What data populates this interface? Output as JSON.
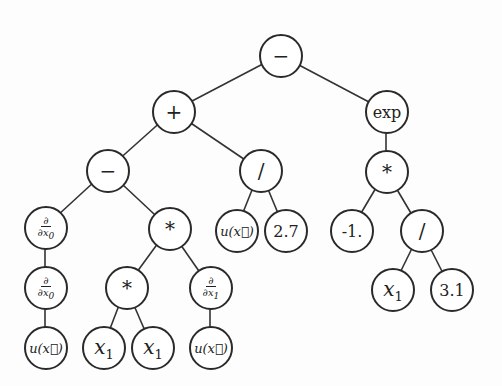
{
  "diagram": {
    "type": "expression-tree",
    "nodes": [
      {
        "id": "root",
        "label": "−",
        "x": 280,
        "y": 55,
        "kind": "op"
      },
      {
        "id": "plus",
        "label": "+",
        "x": 173,
        "y": 111,
        "kind": "op"
      },
      {
        "id": "exp",
        "label": "exp",
        "x": 386,
        "y": 111,
        "kind": "num"
      },
      {
        "id": "minus2",
        "label": "−",
        "x": 107,
        "y": 170,
        "kind": "op"
      },
      {
        "id": "div1",
        "label": "/",
        "x": 260,
        "y": 170,
        "kind": "op"
      },
      {
        "id": "mul_r",
        "label": "*",
        "x": 386,
        "y": 171,
        "kind": "op"
      },
      {
        "id": "d0a",
        "label_top": "∂",
        "label_bottom": "∂x",
        "sub": "0",
        "x": 45,
        "y": 227,
        "kind": "deriv"
      },
      {
        "id": "mul1",
        "label": "*",
        "x": 169,
        "y": 228,
        "kind": "op"
      },
      {
        "id": "u1",
        "label": "u(x⃗)",
        "x": 236,
        "y": 230,
        "kind": "fn"
      },
      {
        "id": "c27",
        "label": "2.7",
        "x": 285,
        "y": 230,
        "kind": "num"
      },
      {
        "id": "cm1",
        "label": "-1.",
        "x": 351,
        "y": 230,
        "kind": "num"
      },
      {
        "id": "div2",
        "label": "/",
        "x": 421,
        "y": 230,
        "kind": "op"
      },
      {
        "id": "d0b",
        "label_top": "∂",
        "label_bottom": "∂x",
        "sub": "0",
        "x": 45,
        "y": 287,
        "kind": "deriv"
      },
      {
        "id": "mul2",
        "label": "*",
        "x": 126,
        "y": 287,
        "kind": "op"
      },
      {
        "id": "d1",
        "label_top": "∂",
        "label_bottom": "∂x",
        "sub": "1",
        "x": 210,
        "y": 287,
        "kind": "deriv"
      },
      {
        "id": "x1c",
        "label": "x",
        "sub": "1",
        "x": 392,
        "y": 289,
        "kind": "var"
      },
      {
        "id": "c31",
        "label": "3.1",
        "x": 451,
        "y": 289,
        "kind": "num"
      },
      {
        "id": "u2",
        "label": "u(x⃗)",
        "x": 45,
        "y": 347,
        "kind": "fn"
      },
      {
        "id": "x1a",
        "label": "x",
        "sub": "1",
        "x": 103,
        "y": 347,
        "kind": "var"
      },
      {
        "id": "x1b",
        "label": "x",
        "sub": "1",
        "x": 152,
        "y": 347,
        "kind": "var"
      },
      {
        "id": "u3",
        "label": "u(x⃗)",
        "x": 210,
        "y": 347,
        "kind": "fn"
      }
    ],
    "edges": [
      [
        "root",
        "plus"
      ],
      [
        "root",
        "exp"
      ],
      [
        "plus",
        "minus2"
      ],
      [
        "plus",
        "div1"
      ],
      [
        "exp",
        "mul_r"
      ],
      [
        "minus2",
        "d0a"
      ],
      [
        "minus2",
        "mul1"
      ],
      [
        "div1",
        "u1"
      ],
      [
        "div1",
        "c27"
      ],
      [
        "mul_r",
        "cm1"
      ],
      [
        "mul_r",
        "div2"
      ],
      [
        "d0a",
        "d0b"
      ],
      [
        "mul1",
        "mul2"
      ],
      [
        "mul1",
        "d1"
      ],
      [
        "div2",
        "x1c"
      ],
      [
        "div2",
        "c31"
      ],
      [
        "d0b",
        "u2"
      ],
      [
        "mul2",
        "x1a"
      ],
      [
        "mul2",
        "x1b"
      ],
      [
        "d1",
        "u3"
      ]
    ]
  }
}
